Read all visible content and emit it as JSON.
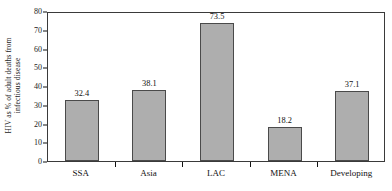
{
  "chart_data": {
    "type": "bar",
    "title": "",
    "subtitle": "",
    "xlabel": "",
    "ylabel": "HIV as % of adult deaths from infectious disease",
    "ylabel_lines": [
      "HIV as % of adult deaths from",
      "infectious disease"
    ],
    "categories": [
      "SSA",
      "Asia",
      "LAC",
      "MENA",
      "Developing"
    ],
    "values": [
      32.4,
      38.1,
      73.5,
      18.2,
      37.1
    ],
    "value_labels": [
      "32.4",
      "38.1",
      "73.5",
      "18.2",
      "37.1"
    ],
    "ylim": [
      0,
      80
    ],
    "ytick_step": 10,
    "ytick_labels": [
      "0",
      "10",
      "20",
      "30",
      "40",
      "50",
      "60",
      "70",
      "80"
    ],
    "ytick_values": [
      0,
      10,
      20,
      30,
      40,
      50,
      60,
      70,
      80
    ],
    "grid": false,
    "legend": null,
    "legend_position": "none",
    "bar_fill_color": "#aeaeae",
    "bar_edge_color": "#4a4a4a",
    "axis_color": "#3a3a3a",
    "text_color": "#111111",
    "background_color": "#ffffff"
  }
}
